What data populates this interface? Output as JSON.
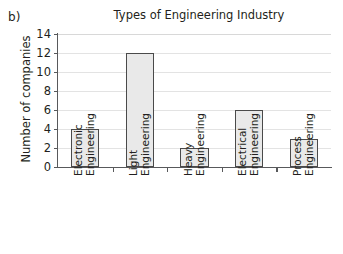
{
  "panel": {
    "label": "b)"
  },
  "chart_data": {
    "type": "bar",
    "title": "Types of Engineering Industry",
    "xlabel": "",
    "ylabel": "Number of companies",
    "categories": [
      "Electronic Engineering",
      "Light Engineering",
      "Heavy Engineering",
      "Electrical Engineering",
      "Process Engineering"
    ],
    "category_lines": [
      {
        "line1": "Electronic",
        "line2": "Engineering"
      },
      {
        "line1": "Light",
        "line2": "Engineering"
      },
      {
        "line1": "Heavy",
        "line2": "Engineering"
      },
      {
        "line1": "Electrical",
        "line2": "Engineering"
      },
      {
        "line1": "Process",
        "line2": "Engineering"
      }
    ],
    "values": [
      4,
      12,
      2,
      6,
      3
    ],
    "ylim": [
      0,
      14
    ],
    "ytick_step": 2,
    "yticks": [
      0,
      2,
      4,
      6,
      8,
      10,
      12,
      14
    ],
    "ytick_labels": [
      "0",
      "2",
      "4",
      "6",
      "8",
      "10",
      "12",
      "14"
    ],
    "grid": true,
    "legend": false,
    "bar_fill": "#e9e9e9",
    "bar_border": "#4a4a4a",
    "grid_color": "#e3e3e3",
    "axis_color": "#58595b",
    "text_color": "#231f20",
    "background": "#ffffff"
  }
}
